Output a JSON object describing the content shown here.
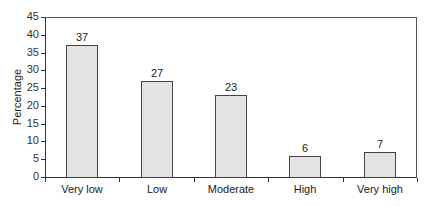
{
  "chart_data": {
    "type": "bar",
    "title": "",
    "xlabel": "",
    "ylabel": "Percentage",
    "categories": [
      "Very low",
      "Low",
      "Moderate",
      "High",
      "Very high"
    ],
    "values": [
      37,
      27,
      23,
      6,
      7
    ],
    "data_labels": [
      "37",
      "27",
      "23",
      "6",
      "7"
    ],
    "ylim": [
      0,
      45
    ],
    "yticks": [
      0,
      5,
      10,
      15,
      20,
      25,
      30,
      35,
      40,
      45
    ],
    "grid": false,
    "legend": null,
    "colors": {
      "bar_fill": "#e3e3e3",
      "bar_edge": "#444444",
      "axis": "#333333"
    }
  }
}
